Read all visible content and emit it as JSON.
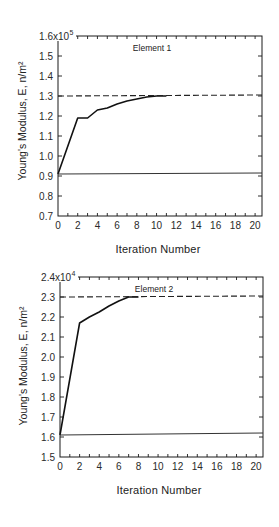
{
  "chart_data": [
    {
      "type": "line",
      "title": "Element 1",
      "xlabel": "Iteration Number",
      "ylabel": "Young's Modulus, E, n/m²",
      "xlim": [
        0,
        20.7
      ],
      "ylim": [
        0.7,
        1.6
      ],
      "grid": false,
      "legend": null,
      "x_minor_ticks_every": 1,
      "x_tick_labels": [
        {
          "value": 0,
          "label": "0"
        },
        {
          "value": 2,
          "label": "2"
        },
        {
          "value": 4,
          "label": "4"
        },
        {
          "value": 6,
          "label": "6"
        },
        {
          "value": 8,
          "label": "8"
        },
        {
          "value": 10,
          "label": "10"
        },
        {
          "value": 12,
          "label": "12"
        },
        {
          "value": 14,
          "label": "14"
        },
        {
          "value": 16,
          "label": "16"
        },
        {
          "value": 18,
          "label": "18"
        },
        {
          "value": 20,
          "label": "20"
        }
      ],
      "y_ticks": [
        {
          "value": 0.7,
          "label": "0.7"
        },
        {
          "value": 0.8,
          "label": "0.8"
        },
        {
          "value": 0.9,
          "label": "0.9"
        },
        {
          "value": 1.0,
          "label": "1.0"
        },
        {
          "value": 1.1,
          "label": "1.1"
        },
        {
          "value": 1.2,
          "label": "1.2"
        },
        {
          "value": 1.3,
          "label": "1.3"
        },
        {
          "value": 1.4,
          "label": "1.4"
        },
        {
          "value": 1.5,
          "label": "1.5"
        },
        {
          "value": 1.6,
          "label": "1.6"
        }
      ],
      "y_multiplier": {
        "text": "x10",
        "exponent": "5"
      },
      "series": [
        {
          "name": "curve",
          "style": "solid-bold",
          "x": [
            0,
            2,
            3,
            4,
            5,
            6,
            7,
            8,
            9,
            10,
            11
          ],
          "y": [
            0.91,
            1.19,
            1.19,
            1.23,
            1.24,
            1.26,
            1.275,
            1.285,
            1.295,
            1.3,
            1.3
          ]
        },
        {
          "name": "dashed_line",
          "style": "dashed",
          "x": [
            0,
            20.7
          ],
          "y": [
            1.3,
            1.305
          ]
        },
        {
          "name": "solid_line",
          "style": "solid-thin",
          "x": [
            0,
            20.7
          ],
          "y": [
            0.91,
            0.915
          ]
        }
      ]
    },
    {
      "type": "line",
      "title": "Element 2",
      "xlabel": "Iteration Number",
      "ylabel": "Young's Modulus, E, n/m²",
      "xlim": [
        0,
        20.7
      ],
      "ylim": [
        1.5,
        2.4
      ],
      "grid": false,
      "legend": null,
      "x_minor_ticks_every": 1,
      "x_tick_labels": [
        {
          "value": 0,
          "label": "0"
        },
        {
          "value": 2,
          "label": "2"
        },
        {
          "value": 4,
          "label": "4"
        },
        {
          "value": 6,
          "label": "6"
        },
        {
          "value": 8,
          "label": "8"
        },
        {
          "value": 10,
          "label": "10"
        },
        {
          "value": 12,
          "label": "12"
        },
        {
          "value": 14,
          "label": "14"
        },
        {
          "value": 16,
          "label": "16"
        },
        {
          "value": 18,
          "label": "18"
        },
        {
          "value": 20,
          "label": "20"
        }
      ],
      "y_ticks": [
        {
          "value": 1.5,
          "label": "1.5"
        },
        {
          "value": 1.6,
          "label": "1.6"
        },
        {
          "value": 1.7,
          "label": "1.7"
        },
        {
          "value": 1.8,
          "label": "1.8"
        },
        {
          "value": 1.9,
          "label": "1.9"
        },
        {
          "value": 2.0,
          "label": "2.0"
        },
        {
          "value": 2.1,
          "label": "2.1"
        },
        {
          "value": 2.2,
          "label": "2.2"
        },
        {
          "value": 2.3,
          "label": "2.3"
        },
        {
          "value": 2.4,
          "label": "2.4"
        }
      ],
      "y_multiplier": {
        "text": "x10",
        "exponent": "4"
      },
      "series": [
        {
          "name": "curve",
          "style": "solid-bold",
          "x": [
            0,
            2,
            3,
            4,
            5,
            6,
            7,
            8
          ],
          "y": [
            1.61,
            2.17,
            2.2,
            2.225,
            2.255,
            2.28,
            2.3,
            2.3
          ]
        },
        {
          "name": "dashed_line",
          "style": "dashed",
          "x": [
            0,
            20.7
          ],
          "y": [
            2.3,
            2.305
          ]
        },
        {
          "name": "solid_line",
          "style": "solid-thin",
          "x": [
            0,
            20.7
          ],
          "y": [
            1.61,
            1.62
          ]
        }
      ]
    }
  ]
}
